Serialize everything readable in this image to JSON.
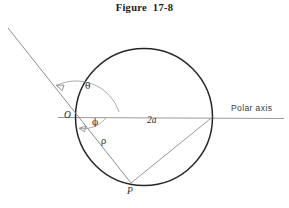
{
  "figure": {
    "title": "Figure  17-8",
    "caption_number": "17-8"
  },
  "labels": {
    "origin": "O",
    "point_p": "P",
    "theta": "θ",
    "phi": "ϕ",
    "rho": "ρ",
    "diameter": "2a",
    "polar_axis": "Polar axis"
  },
  "colors": {
    "circle_stroke": "#262626",
    "line_stroke": "#8a8a8a",
    "arc_stroke": "#9a9a9a",
    "text": "#2b2b2b",
    "background": "#ffffff"
  },
  "geometry": {
    "circle": {
      "cx": 144,
      "cy": 117,
      "r": 68.5
    },
    "origin_point": {
      "x": 76,
      "y": 117
    },
    "point_p": {
      "x": 131,
      "y": 183
    },
    "right_point": {
      "x": 212.5,
      "y": 117
    },
    "polar_axis": {
      "x1": 58,
      "y1": 117,
      "x2": 284,
      "y2": 118
    },
    "tangent_line": {
      "x1": 8,
      "y1": 28,
      "x2": 131,
      "y2": 183
    },
    "theta_arc_label_pos": {
      "x": 88,
      "y": 88
    },
    "phi_arc_label_pos": {
      "x": 95,
      "y": 122
    },
    "rho_label_pos": {
      "x": 103,
      "y": 141
    },
    "diameter_label_pos": {
      "x": 152,
      "y": 120
    },
    "polar_axis_label_pos": {
      "x": 232,
      "y": 108
    }
  }
}
